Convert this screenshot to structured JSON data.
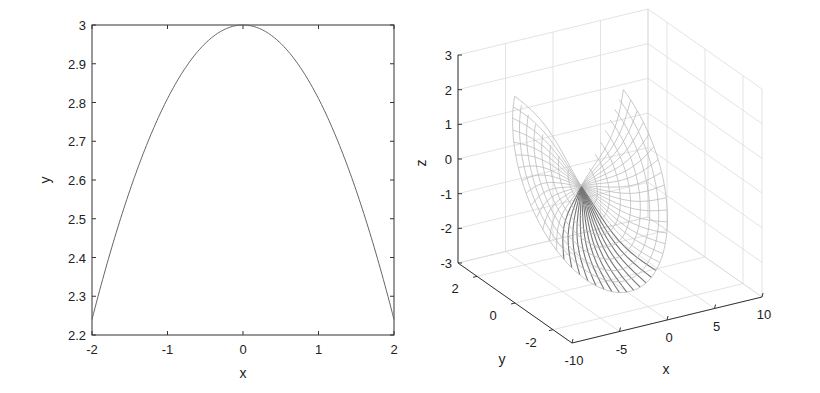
{
  "chart_data": [
    {
      "type": "line",
      "title": "",
      "xlabel": "x",
      "ylabel": "y",
      "xlim": [
        -2,
        2
      ],
      "ylim": [
        2.2,
        3
      ],
      "xticks": [
        "-2",
        "-1",
        "0",
        "1",
        "2"
      ],
      "yticks": [
        "2.2",
        "2.3",
        "2.4",
        "2.5",
        "2.6",
        "2.7",
        "2.8",
        "2.9",
        "3"
      ],
      "grid": false,
      "series": [
        {
          "name": "y(x)",
          "color": "#555555",
          "x": [
            -2,
            -1.5,
            -1,
            -0.5,
            0,
            0.5,
            1,
            1.5,
            2
          ],
          "y": [
            2.24,
            2.57,
            2.81,
            2.95,
            3.0,
            2.95,
            2.81,
            2.57,
            2.24
          ]
        }
      ]
    },
    {
      "type": "surface3d",
      "title": "",
      "xlabel": "x",
      "ylabel": "y",
      "zlabel": "z",
      "xlim": [
        -10,
        10
      ],
      "ylim": [
        -3,
        3
      ],
      "zlim": [
        -3,
        3
      ],
      "xticks": [
        "-10",
        "-5",
        "0",
        "5",
        "10"
      ],
      "yticks": [
        "-2",
        "0",
        "2"
      ],
      "zticks": [
        "-3",
        "-2",
        "-1",
        "0",
        "1",
        "2",
        "3"
      ],
      "grid": true,
      "description": "Wireframe mesh surface of revolution (bowl/paraboloid shape) with radial lines converging at a center point near x≈-5, z≈-0.8",
      "mesh_color": "#999999"
    }
  ]
}
